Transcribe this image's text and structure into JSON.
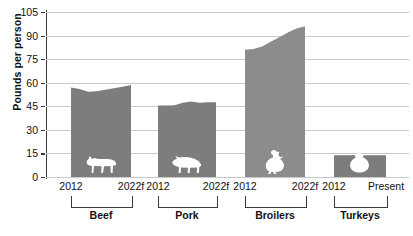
{
  "chart_data": {
    "type": "area",
    "title": "",
    "xlabel": "",
    "ylabel": "Pounds per person",
    "ylim": [
      0,
      105
    ],
    "yticks": [
      0,
      15,
      30,
      45,
      60,
      75,
      90,
      105
    ],
    "grid": true,
    "legend": "none",
    "groups": [
      {
        "name": "Beef",
        "icon": "cow-icon",
        "start_label": "2012",
        "end_label": "2022f",
        "start_value": 57,
        "end_value": 58.5,
        "min_value": 54,
        "values": [
          57,
          56,
          54.2,
          54.5,
          55.5,
          56.5,
          57.5,
          58.5
        ],
        "color": "#7d7d7d"
      },
      {
        "name": "Pork",
        "icon": "pig-icon",
        "start_label": "2012",
        "end_label": "2022f",
        "start_value": 45.5,
        "end_value": 47.5,
        "min_value": 45.5,
        "values": [
          45.5,
          45.5,
          45.6,
          47.2,
          48,
          47.2,
          47.5,
          47.5
        ],
        "color": "#7d7d7d"
      },
      {
        "name": "Broilers",
        "icon": "chicken-icon",
        "start_label": "2012",
        "end_label": "2022f",
        "start_value": 81,
        "end_value": 96,
        "min_value": 81,
        "values": [
          81,
          81.5,
          83,
          86,
          89,
          92,
          94.5,
          96
        ],
        "color": "#8c8c8c"
      },
      {
        "name": "Turkeys",
        "icon": "turkey-icon",
        "start_label": "2012",
        "end_label": "Present",
        "start_value": 13.8,
        "end_value": 13.8,
        "min_value": 13.5,
        "values": [
          13.8,
          13.8,
          13.9,
          14,
          13.9,
          13.8,
          13.8,
          13.8
        ],
        "color": "#7d7d7d"
      }
    ]
  },
  "axis": {
    "y_title": "Pounds per person",
    "y_tick_labels": [
      "105",
      "90",
      "75",
      "60",
      "45",
      "30",
      "15",
      "0"
    ]
  }
}
